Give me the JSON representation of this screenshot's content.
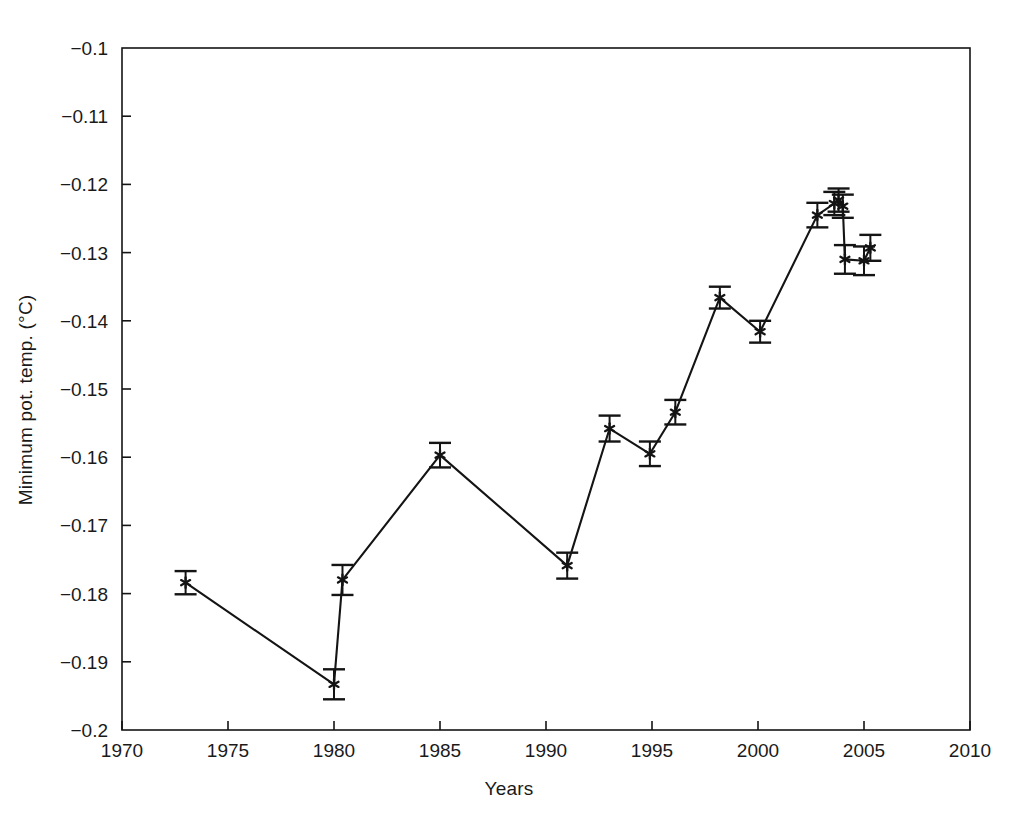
{
  "chart_data": {
    "type": "line",
    "title": "",
    "xlabel": "Years",
    "ylabel": "Minimum pot. temp. (°C)",
    "xlim": [
      1970,
      2010
    ],
    "ylim": [
      -0.2,
      -0.1
    ],
    "xticks": [
      1970,
      1975,
      1980,
      1985,
      1990,
      1995,
      2000,
      2005,
      2010
    ],
    "xticklabels": [
      "1970",
      "1975",
      "1980",
      "1985",
      "1990",
      "1995",
      "2000",
      "2005",
      "2010"
    ],
    "yticks": [
      -0.2,
      -0.19,
      -0.18,
      -0.17,
      -0.16,
      -0.15,
      -0.14,
      -0.13,
      -0.12,
      -0.11,
      -0.1
    ],
    "yticklabels": [
      "−0.2",
      "−0.19",
      "−0.18",
      "−0.17",
      "−0.16",
      "−0.15",
      "−0.14",
      "−0.13",
      "−0.12",
      "−0.11",
      "−0.1"
    ],
    "grid": false,
    "legend": null,
    "marker": "star-with-errorbars",
    "line_color": "#141414",
    "marker_color": "#141414",
    "series": [
      {
        "name": "Minimum potential temperature",
        "x": [
          1973.0,
          1980.0,
          1980.4,
          1985.0,
          1991.0,
          1993.0,
          1994.9,
          1996.1,
          1998.2,
          2000.1,
          2002.8,
          2003.6,
          2003.8,
          2004.0,
          2004.1,
          2005.0,
          2005.3
        ],
        "y": [
          -0.1784,
          -0.1933,
          -0.178,
          -0.1597,
          -0.1759,
          -0.1558,
          -0.1595,
          -0.1534,
          -0.1366,
          -0.1416,
          -0.1245,
          -0.1228,
          -0.1223,
          -0.1232,
          -0.131,
          -0.1312,
          -0.1293
        ],
        "yerr": [
          0.0017,
          0.0022,
          0.0022,
          0.0018,
          0.0019,
          0.0019,
          0.0018,
          0.0018,
          0.0016,
          0.0016,
          0.0018,
          0.0017,
          0.0017,
          0.0017,
          0.0021,
          0.0021,
          0.0019
        ]
      }
    ]
  }
}
